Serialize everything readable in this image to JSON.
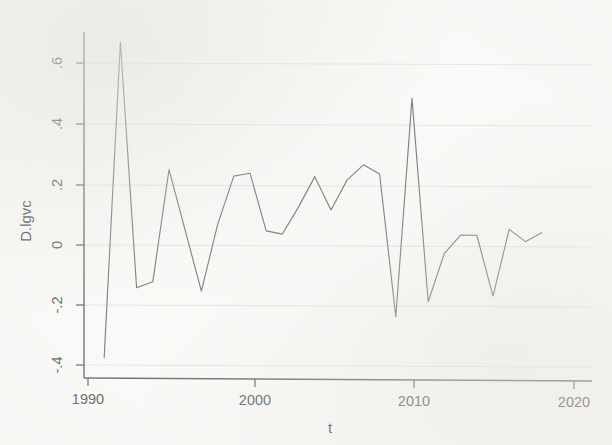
{
  "chart_data": {
    "type": "line",
    "title": "",
    "subtitle": "",
    "xlabel": "t",
    "ylabel": "D.lgvc",
    "xlim": [
      1990,
      2020
    ],
    "ylim": [
      -0.44,
      0.72
    ],
    "grid": true,
    "legend": null,
    "x_ticks": [
      "1990",
      "2000",
      "2010",
      "2020"
    ],
    "x_tick_values": [
      1990,
      2000,
      2010,
      2020
    ],
    "y_ticks": [
      ".6",
      ".4",
      ".2",
      "0",
      "-.2",
      "-.4"
    ],
    "y_tick_values": [
      0.6,
      0.4,
      0.2,
      0,
      -0.2,
      -0.4
    ],
    "line_color": "#6b6b6b",
    "background_color": "#fdfdfc",
    "grid_color": "#dedede",
    "axis_color": "#5a5a5a",
    "series": [
      {
        "name": "D.lgvc",
        "x": [
          1991,
          1992,
          1993,
          1994,
          1995,
          1996,
          1997,
          1998,
          1999,
          2000,
          2001,
          2002,
          2003,
          2004,
          2005,
          2006,
          2007,
          2008,
          2009,
          2010,
          2011,
          2012,
          2013,
          2014,
          2015,
          2016,
          2017,
          2018
        ],
        "values": [
          -0.37,
          0.67,
          -0.14,
          -0.12,
          0.25,
          0.05,
          -0.15,
          0.07,
          0.23,
          0.24,
          0.05,
          0.04,
          0.13,
          0.23,
          0.12,
          0.22,
          0.27,
          0.24,
          -0.23,
          0.49,
          -0.18,
          -0.02,
          0.04,
          0.04,
          -0.16,
          0.06,
          0.02,
          0.05
        ]
      }
    ]
  },
  "axes": {
    "y_axis_title": "D.lgvc",
    "x_axis_title": "t"
  }
}
